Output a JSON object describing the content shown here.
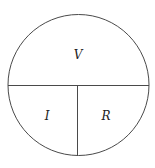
{
  "diagram": {
    "title": "",
    "stroke_color": "#4a4a4a",
    "labels": {
      "top": "V",
      "bottom_left": "I",
      "bottom_right": "R"
    }
  }
}
